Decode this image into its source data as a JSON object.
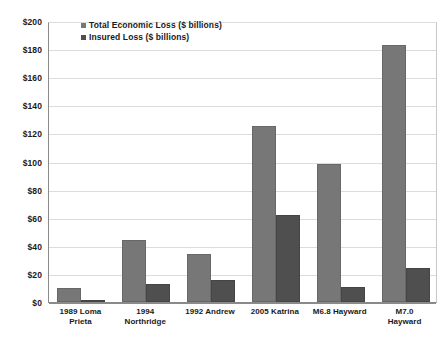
{
  "chart_data": {
    "type": "bar",
    "title": "",
    "xlabel": "",
    "ylabel": "",
    "ylim": [
      0,
      200
    ],
    "y_ticks": [
      "$0",
      "$20",
      "$40",
      "$60",
      "$80",
      "$100",
      "$120",
      "$140",
      "$160",
      "$180",
      "$200"
    ],
    "y_tick_values": [
      0,
      20,
      40,
      60,
      80,
      100,
      120,
      140,
      160,
      180,
      200
    ],
    "grid": true,
    "legend_position": "top-left-inside",
    "categories": [
      "1989 Loma Prieta",
      "1994 Northridge",
      "1992 Andrew",
      "2005 Katrina",
      "M6.8 Hayward",
      "M7.0 Hayward"
    ],
    "category_lines": [
      [
        "1989 Loma",
        "Prieta"
      ],
      [
        "1994",
        "Northridge"
      ],
      [
        "1992 Andrew"
      ],
      [
        "2005 Katrina"
      ],
      [
        "M6.8 Hayward"
      ],
      [
        "M7.0 Hayward"
      ]
    ],
    "series": [
      {
        "name": "Total Economic Loss ($ billions)",
        "color": "#777777",
        "values": [
          10,
          44,
          34,
          125,
          98,
          183
        ]
      },
      {
        "name": "Insured Loss ($ billions)",
        "color": "#4f4f4f",
        "values": [
          1,
          12.5,
          16,
          62,
          11,
          24
        ]
      }
    ]
  },
  "legend": {
    "items": [
      {
        "label": "Total Economic Loss ($ billions)",
        "color": "#777777"
      },
      {
        "label": "Insured Loss ($ billions)",
        "color": "#4f4f4f"
      }
    ]
  }
}
